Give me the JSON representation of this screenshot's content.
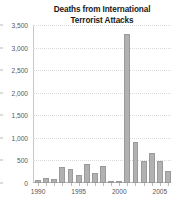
{
  "chart_data": {
    "type": "bar",
    "title": "Deaths from International Terrorist Attacks",
    "title_line1": "Deaths from International",
    "title_line2": "Terrorist Attacks",
    "xlabel": "",
    "ylabel": "",
    "ylim": [
      0,
      3500
    ],
    "grid": true,
    "legend": false,
    "bar_color": "#b1b1b1",
    "bar_edge_color": "#9a9a9a",
    "text_color": "#58585a",
    "title_color": "#1a1a1a",
    "categories": [
      1990,
      1991,
      1992,
      1993,
      1994,
      1995,
      1996,
      1997,
      1998,
      1999,
      2000,
      2001,
      2002,
      2003,
      2004,
      2005,
      2006
    ],
    "values": [
      60,
      110,
      95,
      355,
      320,
      175,
      425,
      230,
      380,
      40,
      55,
      3300,
      900,
      480,
      675,
      480,
      275
    ],
    "ytick_labels": [
      "0",
      "500",
      "1,000",
      "1,500",
      "2,000",
      "2,500",
      "3,000",
      "3,500"
    ],
    "ytick_values": [
      0,
      500,
      1000,
      1500,
      2000,
      2500,
      3000,
      3500
    ],
    "xtick_labels": [
      "1990",
      "1995",
      "2000",
      "2005"
    ],
    "xtick_values": [
      1990,
      1995,
      2000,
      2005
    ]
  }
}
